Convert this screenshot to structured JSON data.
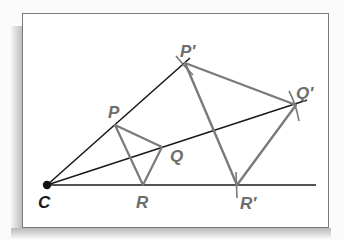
{
  "diagram": {
    "type": "dilation-construction",
    "center": {
      "label": "C",
      "x": 47,
      "y": 185
    },
    "original_triangle": {
      "vertices": [
        {
          "label": "P",
          "x": 115,
          "y": 125
        },
        {
          "label": "Q",
          "x": 162,
          "y": 147
        },
        {
          "label": "R",
          "x": 143,
          "y": 185
        }
      ]
    },
    "image_triangle": {
      "vertices": [
        {
          "label": "P′",
          "x": 185,
          "y": 63
        },
        {
          "label": "Q′",
          "x": 296,
          "y": 105
        },
        {
          "label": "R′",
          "x": 237,
          "y": 185
        }
      ]
    },
    "colors": {
      "ray": "#1a1a1a",
      "triangle": "#7a7a7a",
      "label_dark": "#1a1a1a",
      "label_gray": "#6e6e6e",
      "frame": "#7a7a7a"
    }
  },
  "labels": {
    "C": "C",
    "P": "P",
    "Q": "Q",
    "R": "R",
    "P_prime": "P′",
    "Q_prime": "Q′",
    "R_prime": "R′"
  }
}
